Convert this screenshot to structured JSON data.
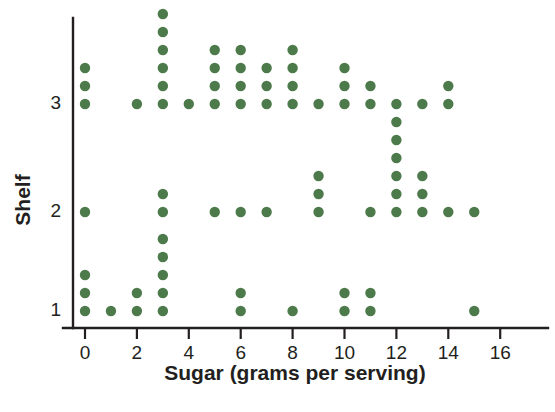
{
  "chart_data": {
    "type": "scatter",
    "title": "",
    "xlabel": "Sugar (grams per serving)",
    "ylabel": "Shelf",
    "xlim": [
      -0.75,
      16.6
    ],
    "ylim": [
      0.82,
      3.62
    ],
    "grid": false,
    "legend": null,
    "xticks": [
      0,
      2,
      4,
      6,
      8,
      10,
      12,
      14,
      16
    ],
    "xtick_labels": [
      "0",
      "2",
      "4",
      "6",
      "8",
      "10",
      "12",
      "14",
      "16"
    ],
    "yticks": [
      1,
      2,
      3
    ],
    "ytick_labels": [
      "1",
      "2",
      "3"
    ],
    "dot_color": "#4d7a4a",
    "axis_color": "#231f20",
    "stack_step": 0.115,
    "dot_radius": 5.2,
    "series": [
      {
        "name": "Shelf 1",
        "shelf": 1,
        "stacks": [
          {
            "x": 0,
            "count": 3
          },
          {
            "x": 1,
            "count": 1
          },
          {
            "x": 2,
            "count": 2
          },
          {
            "x": 3,
            "count": 5
          },
          {
            "x": 6,
            "count": 2
          },
          {
            "x": 8,
            "count": 1
          },
          {
            "x": 10,
            "count": 2
          },
          {
            "x": 11,
            "count": 2
          },
          {
            "x": 15,
            "count": 1
          }
        ],
        "total": 19
      },
      {
        "name": "Shelf 2",
        "shelf": 2,
        "stacks": [
          {
            "x": 0,
            "count": 1
          },
          {
            "x": 3,
            "count": 2
          },
          {
            "x": 5,
            "count": 1
          },
          {
            "x": 6,
            "count": 1
          },
          {
            "x": 7,
            "count": 1
          },
          {
            "x": 9,
            "count": 3
          },
          {
            "x": 11,
            "count": 1
          },
          {
            "x": 12,
            "count": 6
          },
          {
            "x": 13,
            "count": 3
          },
          {
            "x": 14,
            "count": 1
          },
          {
            "x": 15,
            "count": 1
          }
        ],
        "total": 21
      },
      {
        "name": "Shelf 3",
        "shelf": 3,
        "stacks": [
          {
            "x": 0,
            "count": 3
          },
          {
            "x": 2,
            "count": 1
          },
          {
            "x": 3,
            "count": 6
          },
          {
            "x": 4,
            "count": 1
          },
          {
            "x": 5,
            "count": 4
          },
          {
            "x": 6,
            "count": 4
          },
          {
            "x": 7,
            "count": 3
          },
          {
            "x": 8,
            "count": 4
          },
          {
            "x": 9,
            "count": 1
          },
          {
            "x": 10,
            "count": 3
          },
          {
            "x": 11,
            "count": 2
          },
          {
            "x": 12,
            "count": 1
          },
          {
            "x": 13,
            "count": 1
          },
          {
            "x": 14,
            "count": 2
          }
        ],
        "total": 36
      }
    ]
  }
}
